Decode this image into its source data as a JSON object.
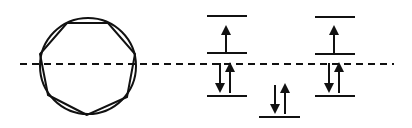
{
  "diagram": {
    "type": "frost-circle-mo-diagram",
    "colors": {
      "ink": "#111111",
      "background": "#ffffff"
    },
    "frost_circle": {
      "center": [
        88,
        66
      ],
      "radius": 48,
      "polygon": "heptagon",
      "vertices": [
        [
          87,
          115
        ],
        [
          48,
          95
        ],
        [
          40,
          54
        ],
        [
          67,
          23
        ],
        [
          108,
          23
        ],
        [
          135,
          54
        ],
        [
          127,
          97
        ]
      ]
    },
    "reference_line": {
      "style": "dashed",
      "y": 64,
      "x_start": 20,
      "x_end": 394
    },
    "energy_levels": [
      {
        "name": "bonding-lowest",
        "x1": 259,
        "x2": 300,
        "y": 116,
        "electrons": "up-down"
      },
      {
        "name": "bonding-left",
        "x1": 207,
        "x2": 247,
        "y": 96,
        "electrons": "up-down"
      },
      {
        "name": "bonding-right",
        "x1": 315,
        "x2": 355,
        "y": 96,
        "electrons": "up-down"
      },
      {
        "name": "antibonding-left-lower",
        "x1": 207,
        "x2": 247,
        "y": 53,
        "electrons": "up"
      },
      {
        "name": "antibonding-right-lower",
        "x1": 315,
        "x2": 355,
        "y": 53,
        "electrons": "up"
      },
      {
        "name": "antibonding-left-upper",
        "x1": 207,
        "x2": 247,
        "y": 16,
        "electrons": "none"
      },
      {
        "name": "antibonding-right-upper",
        "x1": 315,
        "x2": 355,
        "y": 16,
        "electrons": "none"
      }
    ]
  }
}
